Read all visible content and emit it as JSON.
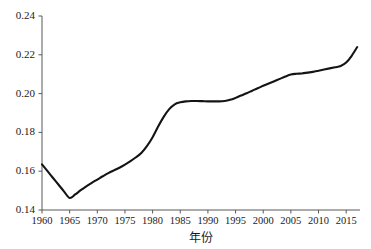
{
  "chart_data": {
    "type": "line",
    "title": "",
    "subtitle": "",
    "xlabel": "年份",
    "ylabel": "",
    "xlim": [
      1960,
      2017.5
    ],
    "ylim": [
      0.14,
      0.24
    ],
    "grid": false,
    "legend": null,
    "xticks": [
      1960,
      1965,
      1970,
      1975,
      1980,
      1985,
      1990,
      1995,
      2000,
      2005,
      2010,
      2015
    ],
    "xtick_labels": [
      "1960",
      "1965",
      "1970",
      "1975",
      "1980",
      "1985",
      "1990",
      "1995",
      "2000",
      "2005",
      "2010",
      "2015"
    ],
    "yticks": [
      0.14,
      0.16,
      0.18,
      0.2,
      0.22,
      0.24
    ],
    "ytick_labels": [
      "0.14",
      "0.16",
      "0.18",
      "0.20",
      "0.22",
      "0.24"
    ],
    "line_color": "#141414",
    "axis_color": "#595959",
    "series": [
      {
        "name": "",
        "x": [
          1960,
          1961,
          1962,
          1963,
          1964,
          1965,
          1966,
          1967,
          1968,
          1969,
          1970,
          1971,
          1972,
          1973,
          1974,
          1975,
          1976,
          1977,
          1978,
          1979,
          1980,
          1981,
          1982,
          1983,
          1984,
          1985,
          1986,
          1987,
          1988,
          1989,
          1990,
          1991,
          1992,
          1993,
          1994,
          1995,
          1996,
          1997,
          1998,
          1999,
          2000,
          2001,
          2002,
          2003,
          2004,
          2005,
          2006,
          2007,
          2008,
          2009,
          2010,
          2011,
          2012,
          2013,
          2014,
          2015,
          2016,
          2017
        ],
        "values": [
          0.1635,
          0.16,
          0.1565,
          0.153,
          0.1495,
          0.1462,
          0.148,
          0.1502,
          0.1522,
          0.154,
          0.1557,
          0.1574,
          0.159,
          0.1604,
          0.1618,
          0.1634,
          0.1652,
          0.1672,
          0.1695,
          0.173,
          0.1775,
          0.183,
          0.188,
          0.192,
          0.1945,
          0.1955,
          0.196,
          0.1962,
          0.1962,
          0.1961,
          0.196,
          0.196,
          0.196,
          0.1962,
          0.1968,
          0.1978,
          0.199,
          0.2002,
          0.2015,
          0.2028,
          0.204,
          0.2052,
          0.2064,
          0.2076,
          0.2088,
          0.2098,
          0.2102,
          0.2104,
          0.2108,
          0.2112,
          0.2118,
          0.2124,
          0.213,
          0.2136,
          0.2142,
          0.216,
          0.2195,
          0.224
        ]
      }
    ]
  }
}
